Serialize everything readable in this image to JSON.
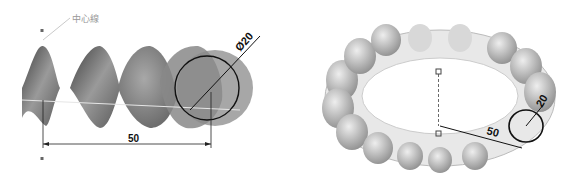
{
  "left_figure": {
    "description": "Helical sweep along straight centerline",
    "centerline_label": "中心線",
    "diameter_label": "Ø20",
    "length_label": "50"
  },
  "right_figure": {
    "description": "Helical sweep along circular path (torus)",
    "diameter_label": "20",
    "radius_label": "50"
  },
  "colors": {
    "surface_dark": "#5a5a5a",
    "surface_mid": "#8c8c8c",
    "surface_light": "#c8c8c8",
    "dimension_line": "#111111",
    "label_gray": "#999999"
  }
}
